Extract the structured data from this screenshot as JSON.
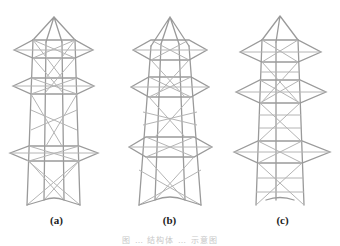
{
  "figure": {
    "panels": [
      {
        "id": "a",
        "label": "(a)"
      },
      {
        "id": "b",
        "label": "(b)"
      },
      {
        "id": "c",
        "label": "(c)"
      }
    ],
    "caption": "图 … 结构体 … 示意图",
    "colors": {
      "background": "#ffffff",
      "member": "#9a9a9a",
      "label": "#222222"
    }
  }
}
